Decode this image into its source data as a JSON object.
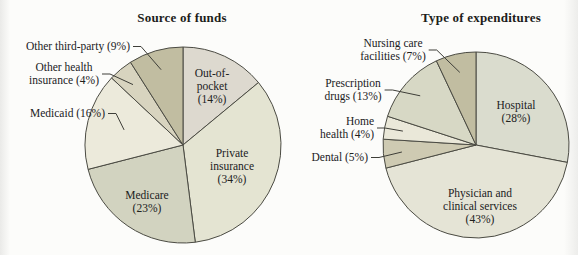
{
  "style": {
    "background": "#fcfcfa",
    "slice_stroke": "#4b4b43",
    "leader_color": "#3e3e38",
    "text_color": "#21211d"
  },
  "chart_data": [
    {
      "type": "pie",
      "title": "Source of funds",
      "start_angle": "12 o'clock, clockwise",
      "legend_position": "none",
      "slices": [
        {
          "name": "Out-of-pocket",
          "pct": 14,
          "label": "Out-of-\npocket\n(14%)",
          "label_placement": "inside",
          "color": "#ddd9cf"
        },
        {
          "name": "Private insurance",
          "pct": 34,
          "label": "Private\ninsurance\n(34%)",
          "label_placement": "inside",
          "color": "#e4e4d2"
        },
        {
          "name": "Medicare",
          "pct": 23,
          "label": "Medicare\n(23%)",
          "label_placement": "inside",
          "color": "#d2d3c0"
        },
        {
          "name": "Medicaid",
          "pct": 16,
          "label": "Medicaid (16%)",
          "label_placement": "outside",
          "color": "#eceadb"
        },
        {
          "name": "Other health insurance",
          "pct": 4,
          "label": "Other health\ninsurance (4%)",
          "label_placement": "outside",
          "color": "#d8d4bf"
        },
        {
          "name": "Other third-party",
          "pct": 9,
          "label": "Other third-party (9%)",
          "label_placement": "outside",
          "color": "#c1bda1"
        }
      ]
    },
    {
      "type": "pie",
      "title": "Type of expenditures",
      "start_angle": "12 o'clock, clockwise",
      "legend_position": "none",
      "slices": [
        {
          "name": "Hospital",
          "pct": 28,
          "label": "Hospital\n(28%)",
          "label_placement": "inside",
          "color": "#dadcce"
        },
        {
          "name": "Physician and clinical services",
          "pct": 43,
          "label": "Physician and\nclinical services\n(43%)",
          "label_placement": "inside",
          "color": "#e5e4d6"
        },
        {
          "name": "Dental",
          "pct": 5,
          "label": "Dental (5%)",
          "label_placement": "outside",
          "color": "#cecab2"
        },
        {
          "name": "Home health",
          "pct": 4,
          "label": "Home\nhealth (4%)",
          "label_placement": "outside",
          "color": "#eae8d9"
        },
        {
          "name": "Prescription drugs",
          "pct": 13,
          "label": "Prescription\ndrugs (13%)",
          "label_placement": "outside",
          "color": "#d7d8c5"
        },
        {
          "name": "Nursing care facilities",
          "pct": 7,
          "label": "Nursing care\nfacilities (7%)",
          "label_placement": "outside",
          "color": "#c1bda1"
        }
      ]
    }
  ]
}
